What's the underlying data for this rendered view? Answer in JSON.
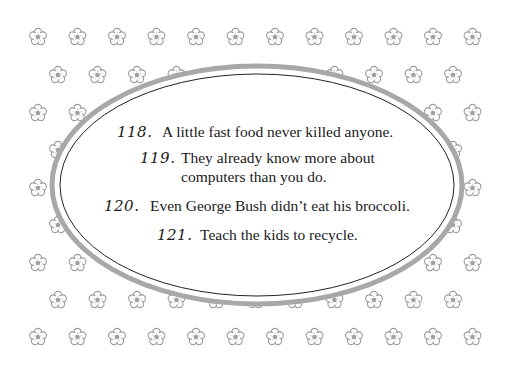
{
  "page": {
    "background_color": "#ffffff",
    "pattern": {
      "icon": "flower-icon",
      "color": "#9a9a9a",
      "rows_y": [
        37,
        75,
        113,
        150,
        188,
        225,
        263,
        300,
        337
      ],
      "odd_row_x_start": 38,
      "even_row_x_start": 58,
      "step_x": 39.5
    },
    "frame": {
      "shape": "ellipse",
      "outer_color": "#a8a8a8",
      "inner_line_color": "#222222"
    }
  },
  "items": [
    {
      "number": "118.",
      "text": "A little fast food never killed anyone."
    },
    {
      "number": "119.",
      "text": "They already know more about",
      "text_line2": "computers than you do."
    },
    {
      "number": "120.",
      "text": "Even George Bush didn’t eat his broccoli."
    },
    {
      "number": "121.",
      "text": "Teach the kids to recycle."
    }
  ]
}
